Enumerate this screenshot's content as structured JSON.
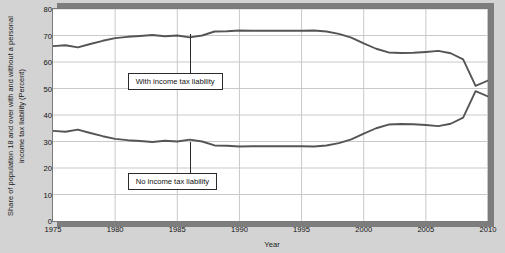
{
  "chart_data": {
    "type": "line",
    "title": "",
    "xlabel": "Year",
    "ylabel": "Share of population 18 and over with and without a personal income tax liability (Percent)",
    "xlim": [
      1975,
      2010
    ],
    "ylim": [
      0,
      80
    ],
    "ytick_step": 10,
    "xtick_step": 5,
    "grid": true,
    "legend_position": "none",
    "xticks": [
      "1975",
      "1980",
      "1985",
      "1990",
      "1995",
      "2000",
      "2005",
      "2010"
    ],
    "yticks": [
      "0",
      "10",
      "20",
      "30",
      "40",
      "50",
      "60",
      "70",
      "80"
    ],
    "x": [
      1975,
      1976,
      1977,
      1978,
      1979,
      1980,
      1981,
      1982,
      1983,
      1984,
      1985,
      1986,
      1987,
      1988,
      1989,
      1990,
      1991,
      1992,
      1993,
      1994,
      1995,
      1996,
      1997,
      1998,
      1999,
      2000,
      2001,
      2002,
      2003,
      2004,
      2005,
      2006,
      2007,
      2008,
      2009,
      2010
    ],
    "series": [
      {
        "name": "With income tax liability",
        "color": "#555555",
        "values": [
          66.0,
          66.3,
          65.5,
          66.8,
          68.0,
          69.0,
          69.5,
          69.8,
          70.2,
          69.7,
          70.0,
          69.3,
          70.0,
          71.5,
          71.6,
          71.9,
          71.8,
          71.8,
          71.8,
          71.8,
          71.8,
          71.9,
          71.5,
          70.6,
          69.2,
          67.0,
          65.0,
          63.6,
          63.4,
          63.5,
          63.8,
          64.2,
          63.3,
          61.0,
          51.0,
          53.0
        ]
      },
      {
        "name": "No income tax liability",
        "color": "#555555",
        "values": [
          34.0,
          33.7,
          34.5,
          33.2,
          32.0,
          31.0,
          30.5,
          30.2,
          29.8,
          30.3,
          30.0,
          30.7,
          30.0,
          28.5,
          28.4,
          28.1,
          28.2,
          28.2,
          28.2,
          28.2,
          28.2,
          28.1,
          28.5,
          29.4,
          30.8,
          33.0,
          35.0,
          36.4,
          36.6,
          36.5,
          36.2,
          35.8,
          36.7,
          39.0,
          49.0,
          47.0
        ]
      }
    ],
    "annotations": [
      {
        "label": "With income tax liability",
        "anchor_x": 1986,
        "anchor_y": 70.5
      },
      {
        "label": "No income tax liability",
        "anchor_x": 1986,
        "anchor_y": 29.8
      }
    ]
  }
}
